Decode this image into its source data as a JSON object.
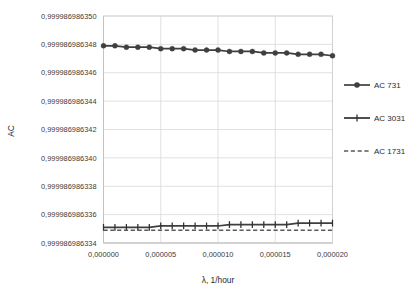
{
  "chart_data": {
    "type": "line",
    "title": "",
    "xlabel": "λ, 1/hour",
    "ylabel": "AC",
    "xlim": [
      0.0,
      2e-05
    ],
    "ylim": [
      0.999986986334,
      0.99998698635
    ],
    "grid": true,
    "legend_position": "right",
    "x_tick_labels": [
      "0,000000",
      "0,000005",
      "0,000010",
      "0,000015",
      "0,000020"
    ],
    "x_tick_values": [
      0.0,
      5e-06,
      1e-05,
      1.5e-05,
      2e-05
    ],
    "y_tick_labels": [
      "0,999986986350",
      "0,999986986348",
      "0,999986986346",
      "0,999986986344",
      "0,999986986342",
      "0,999986986340",
      "0,999986986338",
      "0,999986986336",
      "0,999986986334"
    ],
    "y_tick_values": [
      0.99998698635,
      0.999986986348,
      0.999986986346,
      0.999986986344,
      0.999986986342,
      0.99998698634,
      0.999986986338,
      0.999986986336,
      0.999986986334
    ],
    "x": [
      0.0,
      1e-06,
      2e-06,
      3e-06,
      4e-06,
      5e-06,
      6e-06,
      7e-06,
      8e-06,
      9e-06,
      1e-05,
      1.1e-05,
      1.2e-05,
      1.3e-05,
      1.4e-05,
      1.5e-05,
      1.6e-05,
      1.7e-05,
      1.8e-05,
      1.9e-05,
      2e-05
    ],
    "series": [
      {
        "name": "AC 731",
        "style": "solid",
        "marker": "circle",
        "color": "#3f3f3f",
        "values": [
          0.9999869863479,
          0.9999869863479,
          0.9999869863478,
          0.9999869863478,
          0.9999869863478,
          0.9999869863477,
          0.9999869863477,
          0.9999869863477,
          0.9999869863476,
          0.9999869863476,
          0.9999869863476,
          0.9999869863475,
          0.9999869863475,
          0.9999869863475,
          0.9999869863474,
          0.9999869863474,
          0.9999869863474,
          0.9999869863473,
          0.9999869863473,
          0.9999869863473,
          0.9999869863472
        ]
      },
      {
        "name": "AC 3031",
        "style": "solid",
        "marker": "plus",
        "color": "#2f2f2f",
        "values": [
          0.9999869863351,
          0.9999869863351,
          0.9999869863351,
          0.9999869863351,
          0.9999869863351,
          0.9999869863352,
          0.9999869863352,
          0.9999869863352,
          0.9999869863352,
          0.9999869863352,
          0.9999869863352,
          0.9999869863353,
          0.9999869863353,
          0.9999869863353,
          0.9999869863353,
          0.9999869863353,
          0.9999869863353,
          0.9999869863354,
          0.9999869863354,
          0.9999869863354,
          0.9999869863354
        ]
      },
      {
        "name": "AC 1731",
        "style": "dashed",
        "marker": "none",
        "color": "#5a5a5a",
        "values": [
          0.9999869863349,
          0.9999869863349,
          0.9999869863349,
          0.9999869863349,
          0.9999869863349,
          0.9999869863349,
          0.9999869863349,
          0.9999869863349,
          0.9999869863349,
          0.9999869863349,
          0.9999869863349,
          0.9999869863349,
          0.9999869863349,
          0.9999869863349,
          0.9999869863349,
          0.9999869863349,
          0.9999869863349,
          0.9999869863349,
          0.9999869863349,
          0.9999869863349,
          0.9999869863349
        ]
      }
    ]
  }
}
